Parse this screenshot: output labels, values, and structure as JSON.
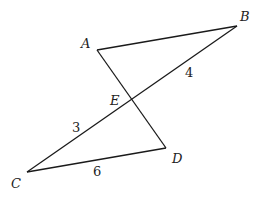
{
  "diagram": {
    "points": {
      "A": {
        "label": "A",
        "x": 97,
        "y": 50
      },
      "B": {
        "label": "B",
        "x": 237,
        "y": 26
      },
      "C": {
        "label": "C",
        "x": 27,
        "y": 172
      },
      "D": {
        "label": "D",
        "x": 166,
        "y": 148
      },
      "E": {
        "label": "E",
        "x": 131,
        "y": 100
      }
    },
    "segments": [
      "AB",
      "AD",
      "CB",
      "CD"
    ],
    "lengths": {
      "EB": "4",
      "CE": "3",
      "CD": "6"
    }
  }
}
